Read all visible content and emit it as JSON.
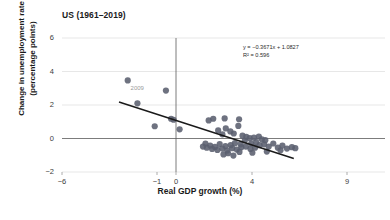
{
  "chart_data": {
    "type": "scatter",
    "title": "US (1961–2019)",
    "xlabel": "Real GDP growth (%)",
    "ylabel": "Change in unemployment rate (percentage points)",
    "xlim": [
      -6,
      11
    ],
    "ylim": [
      -2,
      6.6
    ],
    "xticks": [
      -6,
      -1,
      0,
      4,
      9
    ],
    "xtick_labels": [
      "−6",
      "−1",
      "0",
      "4",
      "9"
    ],
    "yticks": [
      -2,
      0,
      2,
      4,
      6
    ],
    "ytick_labels": [
      "−2",
      "0",
      "2",
      "4",
      "6"
    ],
    "grid": "horizontal",
    "legend": "none",
    "annotations": [
      {
        "text": "2009",
        "x": -2.6,
        "y": 3.0,
        "color": "#9a9a9a"
      }
    ],
    "trendline": {
      "equation": "y = −0.3671x + 1.0827",
      "r_squared_label": "R² = 0.596",
      "slope": -0.3671,
      "intercept": 1.0827,
      "r_squared": 0.596,
      "x_start": -3.0,
      "x_end": 6.2,
      "color": "#1a1a1a"
    },
    "marker": {
      "color": "#5a5f6e",
      "size": 3.1,
      "shape": "circle"
    },
    "points": [
      {
        "x": -2.54,
        "y": 3.47
      },
      {
        "x": -2.03,
        "y": 2.1
      },
      {
        "x": -0.53,
        "y": 2.86
      },
      {
        "x": -0.26,
        "y": 1.18
      },
      {
        "x": -0.13,
        "y": 1.12
      },
      {
        "x": -1.12,
        "y": 0.73
      },
      {
        "x": 0.19,
        "y": 0.55
      },
      {
        "x": 1.72,
        "y": 1.08
      },
      {
        "x": 1.96,
        "y": 1.18
      },
      {
        "x": 2.56,
        "y": 1.2
      },
      {
        "x": 3.32,
        "y": 1.15
      },
      {
        "x": 2.62,
        "y": 0.6
      },
      {
        "x": 3.28,
        "y": 0.75
      },
      {
        "x": 2.22,
        "y": 0.48
      },
      {
        "x": 2.86,
        "y": 0.42
      },
      {
        "x": 3.04,
        "y": 0.3
      },
      {
        "x": 2.44,
        "y": 0.25
      },
      {
        "x": 3.5,
        "y": 0.17
      },
      {
        "x": 3.7,
        "y": 0.1
      },
      {
        "x": 3.88,
        "y": 0.02
      },
      {
        "x": 4.1,
        "y": 0.05
      },
      {
        "x": 4.36,
        "y": 0.12
      },
      {
        "x": 4.52,
        "y": -0.05
      },
      {
        "x": 4.7,
        "y": -0.1
      },
      {
        "x": 4.22,
        "y": -0.22
      },
      {
        "x": 3.96,
        "y": -0.3
      },
      {
        "x": 3.62,
        "y": -0.12
      },
      {
        "x": 3.4,
        "y": -0.35
      },
      {
        "x": 3.1,
        "y": -0.28
      },
      {
        "x": 2.88,
        "y": -0.4
      },
      {
        "x": 2.6,
        "y": -0.45
      },
      {
        "x": 2.3,
        "y": -0.33
      },
      {
        "x": 2.05,
        "y": -0.5
      },
      {
        "x": 1.8,
        "y": -0.42
      },
      {
        "x": 1.62,
        "y": -0.55
      },
      {
        "x": 1.9,
        "y": -0.62
      },
      {
        "x": 2.18,
        "y": -0.68
      },
      {
        "x": 2.44,
        "y": -0.6
      },
      {
        "x": 2.7,
        "y": -0.72
      },
      {
        "x": 2.96,
        "y": -0.58
      },
      {
        "x": 3.2,
        "y": -0.66
      },
      {
        "x": 3.44,
        "y": -0.52
      },
      {
        "x": 3.68,
        "y": -0.48
      },
      {
        "x": 3.92,
        "y": -0.62
      },
      {
        "x": 4.16,
        "y": -0.55
      },
      {
        "x": 4.4,
        "y": -0.4
      },
      {
        "x": 4.64,
        "y": -0.35
      },
      {
        "x": 4.88,
        "y": -0.48
      },
      {
        "x": 5.12,
        "y": -0.3
      },
      {
        "x": 5.36,
        "y": -0.55
      },
      {
        "x": 5.6,
        "y": -0.42
      },
      {
        "x": 5.84,
        "y": -0.6
      },
      {
        "x": 6.1,
        "y": -0.52
      },
      {
        "x": 6.28,
        "y": -0.58
      },
      {
        "x": 2.74,
        "y": -0.88
      },
      {
        "x": 3.02,
        "y": -1.02
      },
      {
        "x": 2.5,
        "y": -0.95
      },
      {
        "x": 3.34,
        "y": -0.8
      },
      {
        "x": 4.02,
        "y": -0.85
      },
      {
        "x": 4.78,
        "y": -0.78
      },
      {
        "x": 5.5,
        "y": -0.7
      },
      {
        "x": 1.55,
        "y": -0.3
      },
      {
        "x": 1.42,
        "y": -0.48
      }
    ]
  }
}
